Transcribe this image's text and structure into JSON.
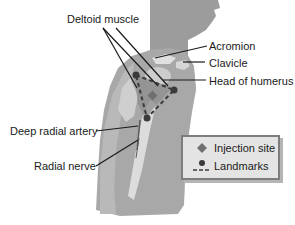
{
  "diagram": {
    "labels": {
      "deltoid_muscle": "Deltoid muscle",
      "acromion": "Acromion",
      "clavicle": "Clavicle",
      "head_of_humerus": "Head of humerus",
      "deep_radial_artery": "Deep radial artery",
      "radial_nerve": "Radial nerve"
    },
    "legend": {
      "items": [
        {
          "symbol": "diamond",
          "label": "Injection site"
        },
        {
          "symbol": "dot-dashed-line",
          "label": "Landmarks"
        }
      ]
    },
    "colors": {
      "body_fill": "#a9a9a9",
      "body_dark": "#8f8f8f",
      "bone_fill": "#d8d8d8",
      "landmark": "#3a3a3a",
      "injection_site": "#6f6f6f",
      "legend_bg": "#e4e4e4",
      "legend_border": "#7d7d7d"
    }
  }
}
